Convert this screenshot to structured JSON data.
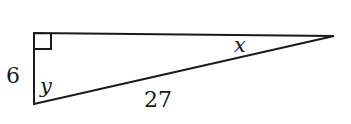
{
  "diagram": {
    "type": "right-triangle",
    "stroke_color": "#1a1a1a",
    "vertices": {
      "right_angle": [
        34,
        33
      ],
      "bottom": [
        34,
        104
      ],
      "far_right": [
        334,
        36
      ]
    },
    "right_angle_marker": {
      "size": 16,
      "position": "top-left vertex"
    },
    "labels": {
      "left_leg": "6",
      "hypotenuse": "27",
      "angle_bottom": "y",
      "angle_right": "x"
    }
  }
}
